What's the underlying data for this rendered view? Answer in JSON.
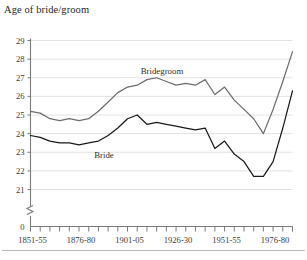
{
  "figure": {
    "title": "Age of bride/groom",
    "footer_rule": true,
    "background": "#ffffff"
  },
  "colors": {
    "bridegroom_line": "#6d6d6d",
    "bride_line": "#1a1a1a",
    "axis": "#7a7a7a",
    "gridline": "#e2e2e2",
    "text": "#2b2b2b",
    "footer_rule": "#b9b9b9"
  },
  "chart_data": {
    "type": "line",
    "title": "Age of bride/groom",
    "xlabel": "",
    "ylabel": "",
    "ylim": [
      20.6,
      29.3
    ],
    "y_axis_break": true,
    "y_axis_break_label": "0",
    "grid": true,
    "grid_axis": "y",
    "legend_position": "inline-annotations",
    "yticks": [
      21,
      22,
      23,
      24,
      25,
      26,
      27,
      28,
      29
    ],
    "ytick_labels": [
      "21",
      "22",
      "23",
      "24",
      "25",
      "26",
      "27",
      "28",
      "29"
    ],
    "x_categories": [
      "1851-55",
      "1856-60",
      "1861-65",
      "1866-70",
      "1871-75",
      "1876-80",
      "1881-85",
      "1886-90",
      "1891-95",
      "1896-00",
      "1901-05",
      "1906-10",
      "1911-15",
      "1916-20",
      "1921-25",
      "1926-30",
      "1931-35",
      "1936-40",
      "1941-45",
      "1946-50",
      "1951-55",
      "1956-60",
      "1961-65",
      "1966-70",
      "1971-75",
      "1976-80",
      "1981-85",
      "1986-90"
    ],
    "xtick_labels_shown": [
      "1851-55",
      "1876-80",
      "1901-05",
      "1926-30",
      "1951-55",
      "1976-80"
    ],
    "xtick_label_indices": [
      0,
      5,
      10,
      15,
      20,
      25
    ],
    "n_ticks": 28,
    "series": [
      {
        "name": "Bridegroom",
        "color": "#6d6d6d",
        "label_text": "Bridegroom",
        "values": [
          25.2,
          25.1,
          24.8,
          24.7,
          24.8,
          24.7,
          24.8,
          25.2,
          25.7,
          26.2,
          26.5,
          26.6,
          26.9,
          27.0,
          26.8,
          26.6,
          26.7,
          26.6,
          26.9,
          26.1,
          26.5,
          25.8,
          25.3,
          24.8,
          24.0,
          25.3,
          26.8,
          28.4
        ]
      },
      {
        "name": "Bride",
        "color": "#1a1a1a",
        "label_text": "Bride",
        "values": [
          23.9,
          23.8,
          23.6,
          23.5,
          23.5,
          23.4,
          23.5,
          23.6,
          23.9,
          24.3,
          24.8,
          25.0,
          24.5,
          24.6,
          24.5,
          24.4,
          24.3,
          24.2,
          24.3,
          23.2,
          23.6,
          22.9,
          22.5,
          21.7,
          21.7,
          22.5,
          24.3,
          26.3
        ]
      }
    ]
  }
}
